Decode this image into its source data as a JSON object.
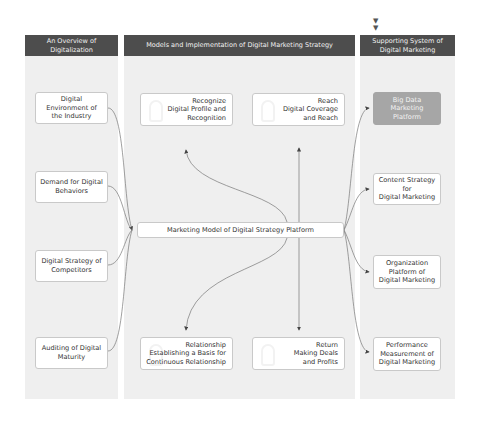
{
  "diagram": {
    "top_marker_icon": "double-down-arrow",
    "columns": [
      {
        "title": "An Overview of Digitalization"
      },
      {
        "title": "Models and Implementation of Digital Marketing Strategy"
      },
      {
        "title": "Supporting System of\nDigital Marketing"
      }
    ],
    "inputs": [
      {
        "label": "Digital Environment of\nthe Industry"
      },
      {
        "label": "Demand for Digital\nBehaviors"
      },
      {
        "label": "Digital Strategy of\nCompetitors"
      },
      {
        "label": "Auditing of Digital\nMaturity"
      }
    ],
    "center": {
      "label": "Marketing Model of Digital Strategy Platform"
    },
    "strategy_boxes": [
      {
        "label": "Recognize\nDigital Profile and\nRecognition"
      },
      {
        "label": "Reach\nDigital Coverage\nand Reach"
      },
      {
        "label": "Relationship\nEstablishing a Basis for\nContinuous Relationship"
      },
      {
        "label": "Return\nMaking Deals\nand Profits"
      }
    ],
    "support": [
      {
        "label": "Big Data Marketing\nPlatform",
        "highlighted": true
      },
      {
        "label": "Content Strategy for\nDigital Marketing"
      },
      {
        "label": "Organization\nPlatform of\nDigital Marketing"
      },
      {
        "label": "Performance\nMeasurement of\nDigital Marketing"
      }
    ],
    "colors": {
      "header_bg": "#4d4d4d",
      "column_bg": "#efefef",
      "box_border": "#c9c9c9",
      "highlight_box": "#a6a6a6",
      "connector": "#666666"
    }
  }
}
